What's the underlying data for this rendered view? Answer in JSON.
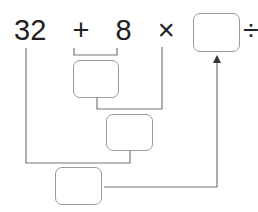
{
  "expression": {
    "tokens": [
      "32",
      "+",
      "8",
      "×",
      "6",
      "÷",
      "2",
      "="
    ]
  },
  "boxes": {
    "result": "",
    "step1": "",
    "step2": "",
    "step3": ""
  },
  "colors": {
    "line": "#777777",
    "box_border": "#9a9a9a",
    "text": "#222222"
  }
}
